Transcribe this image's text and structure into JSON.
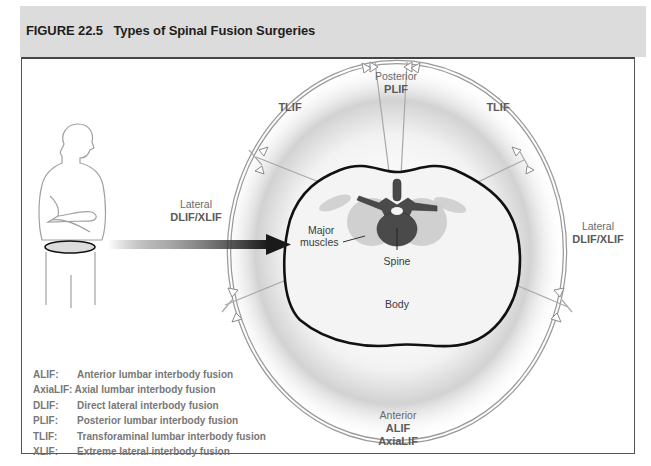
{
  "figure": {
    "title": "FIGURE 22.5   Types of Spinal Fusion Surgeries"
  },
  "diagram": {
    "approaches": {
      "posterior": {
        "direction": "Posterior",
        "procedures": [
          "PLIF"
        ]
      },
      "tlif_left": {
        "procedures": [
          "TLIF"
        ]
      },
      "tlif_right": {
        "procedures": [
          "TLIF"
        ]
      },
      "lateral_left": {
        "direction": "Lateral",
        "procedures": [
          "DLIF/XLIF"
        ]
      },
      "lateral_right": {
        "direction": "Lateral",
        "procedures": [
          "DLIF/XLIF"
        ]
      },
      "anterior": {
        "direction": "Anterior",
        "procedures": [
          "ALIF",
          "AxiaLIF"
        ]
      }
    },
    "anatomy_labels": {
      "muscles": "Major\nmuscles",
      "muscles_line1": "Major",
      "muscles_line2": "muscles",
      "spine": "Spine",
      "body": "Body"
    },
    "colors": {
      "header_band": "#dcdcdc",
      "ring": "#9a9a9a",
      "body_outline": "#111111",
      "spine": "#4a4a4a",
      "muscle": "#c9c9c9",
      "arrow": "#1a1a1a"
    }
  },
  "legend": [
    {
      "abbr": "ALIF:",
      "desc": "Anterior lumbar interbody fusion"
    },
    {
      "abbr": "AxiaLIF:",
      "desc": "Axial lumbar interbody fusion"
    },
    {
      "abbr": "DLIF:",
      "desc": "Direct lateral interbody fusion"
    },
    {
      "abbr": "PLIF:",
      "desc": "Posterior lumbar interbody fusion"
    },
    {
      "abbr": "TLIF:",
      "desc": "Transforaminal lumbar interbody fusion"
    },
    {
      "abbr": "XLIF:",
      "desc": "Extreme lateral interbody fusion"
    }
  ]
}
